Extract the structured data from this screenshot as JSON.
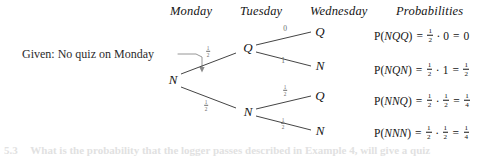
{
  "figure": {
    "type": "probability-tree-diagram",
    "given_label": "Given: No quiz on Monday",
    "columns": [
      {
        "label": "Monday",
        "x": 196
      },
      {
        "label": "Tuesday",
        "x": 267
      },
      {
        "label": "Wednesday",
        "x": 345
      },
      {
        "label": "Probabilities",
        "x": 440
      }
    ],
    "nodes": {
      "root": {
        "label": "N",
        "x": 170,
        "y": 80
      },
      "tue_q": {
        "label": "Q",
        "x": 246,
        "y": 48
      },
      "tue_n": {
        "label": "N",
        "x": 246,
        "y": 112
      },
      "wed_qq": {
        "label": "Q",
        "x": 320,
        "y": 32
      },
      "wed_qn": {
        "label": "N",
        "x": 320,
        "y": 66
      },
      "wed_nq": {
        "label": "Q",
        "x": 320,
        "y": 96
      },
      "wed_nn": {
        "label": "N",
        "x": 320,
        "y": 131
      }
    },
    "edges": [
      {
        "from": "root",
        "to": "tue_q",
        "label_num": "1",
        "label_den": "2",
        "label_x": 208,
        "label_y": 52
      },
      {
        "from": "root",
        "to": "tue_n",
        "label_num": "1",
        "label_den": "2",
        "label_x": 206,
        "label_y": 106
      },
      {
        "from": "tue_q",
        "to": "wed_qq",
        "label_whole": "0",
        "label_x": 285,
        "label_y": 29
      },
      {
        "from": "tue_q",
        "to": "wed_qn",
        "label_whole": "1",
        "label_x": 283,
        "label_y": 61
      },
      {
        "from": "tue_n",
        "to": "wed_nq",
        "label_num": "1",
        "label_den": "2",
        "label_x": 285,
        "label_y": 91
      },
      {
        "from": "tue_n",
        "to": "wed_nn",
        "label_num": "1",
        "label_den": "2",
        "label_x": 283,
        "label_y": 124
      }
    ],
    "probabilities": [
      {
        "event": "NQQ",
        "p_text": "P",
        "arg": "NQQ",
        "factor1_num": "1",
        "factor1_den": "2",
        "factor2_whole": "0",
        "result_whole": "0",
        "y": 36
      },
      {
        "event": "NQN",
        "p_text": "P",
        "arg": "NQN",
        "factor1_num": "1",
        "factor1_den": "2",
        "factor2_whole": "1",
        "result_num": "1",
        "result_den": "2",
        "y": 70
      },
      {
        "event": "NNQ",
        "p_text": "P",
        "arg": "NNQ",
        "factor1_num": "1",
        "factor1_den": "2",
        "factor2_num": "1",
        "factor2_den": "2",
        "result_num": "1",
        "result_den": "4",
        "y": 101
      },
      {
        "event": "NNN",
        "p_text": "P",
        "arg": "NNN",
        "factor1_num": "1",
        "factor1_den": "2",
        "factor2_num": "1",
        "factor2_den": "2",
        "result_num": "1",
        "result_den": "4",
        "y": 133
      }
    ],
    "symbols": {
      "equals": "=",
      "dot": "·",
      "lparen": "(",
      "rparen": ")"
    },
    "caption_fragment": {
      "number": "5.3",
      "text": "What is the probability that the logger passes described in Example 4, will give a quiz"
    },
    "colors": {
      "ink": "#141414",
      "edge_line": "#3a3a3a",
      "edge_label": "#6a6a6a",
      "background": "#ffffff"
    }
  }
}
